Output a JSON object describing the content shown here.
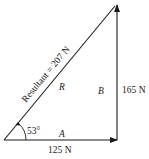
{
  "diagram": {
    "type": "vector-addition-triangle",
    "colors": {
      "line": "#1a1a1a",
      "background": "#ffffff"
    },
    "vectors": {
      "A": {
        "symbol": "A",
        "magnitude_label": "125 N",
        "direction": "horizontal-right"
      },
      "B": {
        "symbol": "B",
        "magnitude_label": "165 N",
        "direction": "vertical-up"
      },
      "R": {
        "symbol": "R",
        "magnitude_label": "Resultant = 207 N",
        "direction": "diagonal"
      }
    },
    "angle": {
      "label": "53°"
    }
  }
}
